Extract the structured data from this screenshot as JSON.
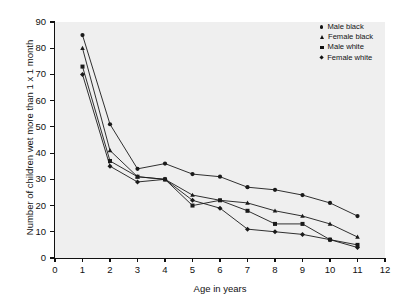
{
  "chart_data": {
    "type": "line",
    "title": "",
    "xlabel": "Age in years",
    "ylabel": "Number of children wet more than 1 x 1 month",
    "xlim": [
      0,
      12
    ],
    "ylim": [
      0,
      90
    ],
    "xticks": [
      0,
      1,
      2,
      3,
      4,
      5,
      6,
      7,
      8,
      9,
      10,
      11,
      12
    ],
    "yticks": [
      0,
      10,
      20,
      30,
      40,
      50,
      60,
      70,
      80,
      90
    ],
    "grid": false,
    "legend_position": "top-right",
    "x": [
      1,
      2,
      3,
      4,
      5,
      6,
      7,
      8,
      9,
      10,
      11
    ],
    "series": [
      {
        "name": "Male black",
        "marker": "circle",
        "values": [
          85,
          51,
          34,
          36,
          32,
          31,
          27,
          26,
          24,
          21,
          16
        ]
      },
      {
        "name": "Female black",
        "marker": "triangle",
        "values": [
          80,
          41,
          31,
          30,
          24,
          22,
          21,
          18,
          16,
          13,
          8
        ]
      },
      {
        "name": "Male white",
        "marker": "square",
        "values": [
          73,
          37,
          31,
          30,
          20,
          22,
          18,
          13,
          13,
          7,
          5
        ]
      },
      {
        "name": "Female white",
        "marker": "diamond",
        "values": [
          70,
          35,
          29,
          30,
          22,
          19,
          11,
          10,
          9,
          7,
          4
        ]
      }
    ]
  },
  "legend": {
    "items": [
      {
        "label": "Male black",
        "marker": "circle"
      },
      {
        "label": "Female black",
        "marker": "triangle"
      },
      {
        "label": "Male white",
        "marker": "square"
      },
      {
        "label": "Female white",
        "marker": "diamond"
      }
    ]
  },
  "colors": {
    "line": "#1a1a1a",
    "plot_background": "#efefef",
    "page_background": "#ffffff",
    "axis": "#111111"
  }
}
